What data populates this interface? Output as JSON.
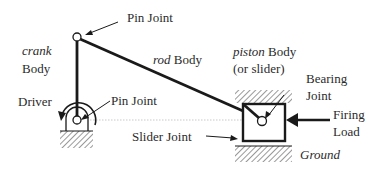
{
  "diagram": {
    "labels": {
      "pin_joint_top": "Pin Joint",
      "crank_italic": "crank",
      "crank_body": "Body",
      "rod_italic": "rod",
      "rod_body": " Body",
      "piston_italic": "piston",
      "piston_body": " Body",
      "piston_sub": "(or slider)",
      "bearing_line1": "Bearing",
      "bearing_line2": "Joint",
      "driver": "Driver",
      "pin_joint_bottom": "Pin Joint",
      "firing_line1": "Firing",
      "firing_line2": "Load",
      "slider_joint": "Slider Joint",
      "ground": "Ground"
    },
    "colors": {
      "line": "#1a1a1a",
      "text": "#2b2b2b",
      "hatch": "#555555",
      "guide": "#bbbbbb"
    }
  }
}
